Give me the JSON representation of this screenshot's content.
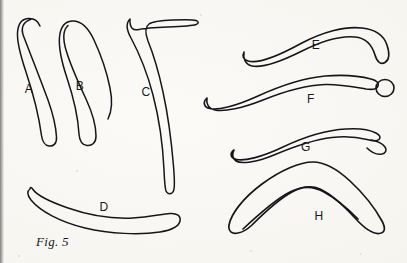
{
  "figure": {
    "caption": "Fig. 5",
    "caption_position": {
      "x": 36,
      "y": 234
    },
    "background_color": "#f8f7f3",
    "ink_color": "#16161a",
    "scan_edge_color": "#6d6d6d",
    "width": 407,
    "height": 263
  },
  "specimens": [
    {
      "id": "A",
      "label": "A",
      "label_position": {
        "x": 29,
        "y": 89
      },
      "description": "slender curved club, hooked rounded top, tapering shaft",
      "outline": "M30.5,19.5 C23,22 20.5,28 23.5,36 C30,53 40,78 48,100 C53,114 56,128 56.5,137 C57,143.5 53.5,146.5 49,146 C44.5,145.5 42.5,142 41.5,135.5 C39,117 33,93 26,72 C21,57 17,43 17.5,33 C18,24 22,19 28,18.5 C34,18 38,21 40,26",
      "stroke_width": 1.5
    },
    {
      "id": "B",
      "label": "B",
      "label_position": {
        "x": 80,
        "y": 86
      },
      "description": "S-curved club, broad mid-body, rounded lower tip",
      "outline": "M68,25.5 C63,30 62.5,38 66,50 C71,67 79,84 86,99 C92,112 96,126 96,136 C96,143 92,146 87,145.5 C82,145 79.5,141 79,134 C78,116 73,96 67,78 C62,63 58.5,48 59.5,37 C60.5,27 65,21.5 72,21 C80.5,20.5 88,27 94,40 C101,55 107,73 110,88 C112.5,100 112,111 108,119",
      "stroke_width": 1.5
    },
    {
      "id": "C",
      "label": "C",
      "label_position": {
        "x": 146,
        "y": 92
      },
      "description": "hooked tool with flared horizontal head and long vertical shaft",
      "outline": "M130,19 C126,23 126.5,30 131,38 C138,51 147,72 153,95 C159,118 163,148 164,170 C164.5,182 165,188 166,191 C167.5,194.5 172,194.5 173.5,191 C175,187.5 174.5,178 173.5,166 C171.5,142 168,115 163,92 C158.5,71 152.5,52 148,41 C145,33 145,27 149,24 C153,21 161,20.5 173,20 C185,19.5 193,19.5 196,20.5 C199,21.5 199,23.5 196,24.5 C192,26 181,26.5 168,27 C155.5,27.5 145,28 139,29.5 C133,31 129.5,28 130,19 Z",
      "stroke_width": 1.5
    },
    {
      "id": "D",
      "label": "D",
      "label_position": {
        "x": 104,
        "y": 207
      },
      "description": "long shallow crescent, rounded left tip, upturned right tip",
      "outline": "M30,189 C27,191 27,195 31,200 C40,211 60,222 85,228 C110,234 140,235 160,232 C172,230 179,226 180,221 C181,216 177,213 170,213.5 C162,214 150,217 133,218 C112,219 88,215 68,208 C48,201 36,194 33,189.5 C31.5,187 30,187 30,189 Z",
      "stroke_width": 1.5
    },
    {
      "id": "E",
      "label": "E",
      "label_position": {
        "x": 316,
        "y": 45
      },
      "description": "boomerang, flat-cut left tip, broad blunt right end",
      "outline": "M244,52 C242,56 243,59.5 248,61 C258,64 278,56 300,44 C322,32 345,26 362,28 C376,29.5 384,36 387,45 C390,54 389,60 385,62.5 C381,65 377,62 375,55 C372,45 366,38 355,37 C341,35.5 322,41 302,51 C282,61 262,68 252,66 C245,64.5 243,58 244,52 Z",
      "stroke_width": 1.6
    },
    {
      "id": "F",
      "label": "F",
      "label_position": {
        "x": 311,
        "y": 99
      },
      "description": "boomerang with elbow bend and round knob at right end",
      "outline": "M207,98 C203,101.5 203.5,106 208,108 C216,111.5 236,106 258,96 C280,86 303,78 325,76 C344,74.5 360,76 371,79 C377,80.5 379,83 378,86 C377,89 373,90 366,89 C354,87 340,84 325,84.5 C305,85 283,92 263,100 C243,108 224,112 215,110 C208,108.5 206,103 207,98 Z",
      "stroke_width": 1.6,
      "knob": {
        "cx": 385,
        "cy": 88,
        "rx": 9,
        "ry": 8.5
      }
    },
    {
      "id": "G",
      "label": "G",
      "label_position": {
        "x": 306,
        "y": 147
      },
      "description": "slim arc boomerang with notched flared right tip",
      "outline": "M234,150 C230,153 230,157 235,159 C243,162 262,157 283,147 C304,137 327,130 346,129 C360,128 370,130 376,133 C380,135 381,137.5 379,139.5 C377,141.5 373,141 367,139.5 C357,137 345,136 332,137.5 C314,139.5 293,147 274,155 C256,162.5 241,164 236,161 C232,158.5 232,153.5 234,150 Z",
      "stroke_width": 1.6,
      "tip_notch": "M371,140 C377,141 382,143 385,147 C387,150 386,153 382,154 C377,155 371,152 367,148"
    },
    {
      "id": "H",
      "label": "H",
      "label_position": {
        "x": 319,
        "y": 216
      },
      "description": "wide angular boomerang, apex at top centre, rounded arm tips",
      "outline": "M238,233 C232,234.5 228,231 229,225 C231,214 243,198 262,184 C281,170 300,162 313,162 C324,162 336,168 350,181 C364,194 376,210 382,221 C386,228.5 385,233 379,233.5 C372,234 364,228 355,218 C344,206 331,194 320,189 C311,185 303,186 292,192 C279,199 264,213 252,225 C245,231.5 241,232.5 238,233 Z",
      "stroke_width": 1.7,
      "inner_edge": "M243,229 C258,215 276,199 290,192 C303,185.5 313,186 324,192 C335,198 348,209 358,219"
    }
  ],
  "specks": [
    {
      "x": 200,
      "y": 14,
      "size": 2
    },
    {
      "x": 76,
      "y": 170,
      "size": 2
    },
    {
      "x": 360,
      "y": 253,
      "size": 2
    },
    {
      "x": 250,
      "y": 250,
      "size": 2
    },
    {
      "x": 18,
      "y": 255,
      "size": 2
    }
  ]
}
